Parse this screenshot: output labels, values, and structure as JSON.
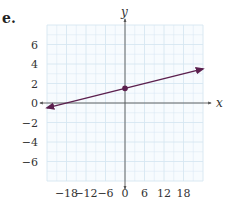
{
  "problem": {
    "label": "e."
  },
  "chart_data": {
    "type": "line",
    "title": "",
    "xlabel": "x",
    "ylabel": "y",
    "xlim": [
      -24,
      24
    ],
    "ylim": [
      -8,
      8
    ],
    "x_ticks": [
      -18,
      -12,
      -6,
      0,
      6,
      12,
      18
    ],
    "x_tick_labels": [
      "−18",
      "−12",
      "−6",
      "0",
      "6",
      "12",
      "18"
    ],
    "y_ticks": [
      6,
      4,
      2,
      0,
      -2,
      -4,
      -6
    ],
    "y_tick_labels": [
      "6",
      "4",
      "2",
      "0",
      "−2",
      "−4",
      "−6"
    ],
    "grid": true,
    "grid_minor_x_step": 3,
    "grid_minor_y_step": 1,
    "series": [
      {
        "name": "line",
        "equation": "y = x/12 + 1.5",
        "slope": 0.0833,
        "intercept": 1.5,
        "x": [
          -24,
          24
        ],
        "y": [
          -0.5,
          3.5
        ],
        "arrows": "both",
        "color": "#5b1f4e"
      }
    ],
    "points": [
      {
        "x": 0,
        "y": 1.5,
        "label": "y-intercept"
      }
    ]
  },
  "colors": {
    "grid": "#d6e6f2",
    "axis": "#555555",
    "line": "#5b1f4e",
    "background": "#ffffff"
  }
}
